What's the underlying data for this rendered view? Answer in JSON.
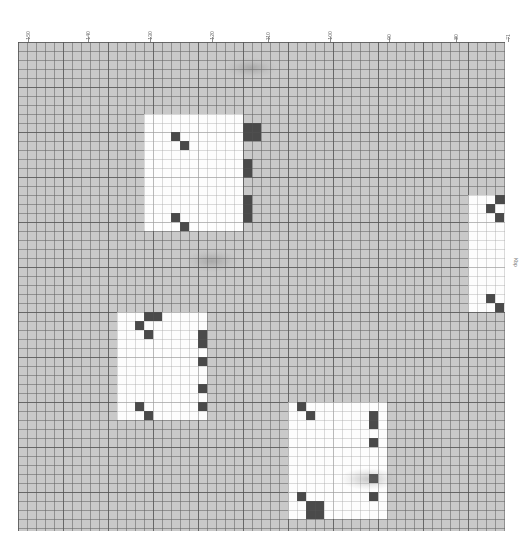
{
  "chart_data": {
    "type": "heatmap",
    "title": "",
    "xlabel": "",
    "ylabel": "",
    "grid": true,
    "legend_position": "none",
    "axis": {
      "orientation": "top",
      "direction": "descending",
      "range": [
        150,
        71
      ],
      "tick_labels": [
        "150",
        "140",
        "130",
        "120",
        "110",
        "100",
        "90",
        "80",
        "71"
      ],
      "tick_positions_px": [
        28,
        88,
        150,
        212,
        268,
        330,
        389,
        456,
        508
      ]
    },
    "right_edge_label": "Kbp",
    "cell_size_px": 9,
    "major_every_cells": 5,
    "colors": {
      "background": "#ffffff",
      "grid_fill": "#c9c9c9",
      "grid_line": "#5f5f5f",
      "block_light": "#fdfdfd",
      "block_dark": "#4a4a4a",
      "tick_text": "#6d6d6d"
    },
    "blocks": [
      {
        "id": "block-1",
        "x_px": 126,
        "y_px": 72,
        "w_px": 99,
        "h_px": 117,
        "notch": {
          "x_px": 126,
          "y_px": 72,
          "w_px": 18,
          "h_px": 27
        },
        "dark_cells": [
          {
            "x_px": 225,
            "y_px": 81,
            "w_px": 18,
            "h_px": 18
          },
          {
            "x_px": 153,
            "y_px": 90,
            "w_px": 9,
            "h_px": 9
          },
          {
            "x_px": 162,
            "y_px": 99,
            "w_px": 9,
            "h_px": 9
          },
          {
            "x_px": 225,
            "y_px": 117,
            "w_px": 9,
            "h_px": 18
          },
          {
            "x_px": 225,
            "y_px": 153,
            "w_px": 9,
            "h_px": 18
          },
          {
            "x_px": 225,
            "y_px": 171,
            "w_px": 9,
            "h_px": 9
          },
          {
            "x_px": 153,
            "y_px": 171,
            "w_px": 9,
            "h_px": 9
          },
          {
            "x_px": 162,
            "y_px": 180,
            "w_px": 9,
            "h_px": 9
          }
        ]
      },
      {
        "id": "block-2",
        "x_px": 450,
        "y_px": 153,
        "w_px": 55,
        "h_px": 117,
        "notch": {
          "x_px": 450,
          "y_px": 153,
          "w_px": 9,
          "h_px": 18
        },
        "dark_cells": [
          {
            "x_px": 477,
            "y_px": 153,
            "w_px": 18,
            "h_px": 9
          },
          {
            "x_px": 468,
            "y_px": 162,
            "w_px": 9,
            "h_px": 9
          },
          {
            "x_px": 477,
            "y_px": 171,
            "w_px": 9,
            "h_px": 9
          },
          {
            "x_px": 468,
            "y_px": 252,
            "w_px": 9,
            "h_px": 9
          },
          {
            "x_px": 477,
            "y_px": 261,
            "w_px": 9,
            "h_px": 9
          }
        ]
      },
      {
        "id": "block-3",
        "x_px": 99,
        "y_px": 270,
        "w_px": 90,
        "h_px": 108,
        "notch": {
          "x_px": 99,
          "y_px": 270,
          "w_px": 9,
          "h_px": 18
        },
        "dark_cells": [
          {
            "x_px": 126,
            "y_px": 270,
            "w_px": 18,
            "h_px": 9
          },
          {
            "x_px": 117,
            "y_px": 279,
            "w_px": 9,
            "h_px": 9
          },
          {
            "x_px": 126,
            "y_px": 288,
            "w_px": 9,
            "h_px": 9
          },
          {
            "x_px": 180,
            "y_px": 288,
            "w_px": 9,
            "h_px": 18
          },
          {
            "x_px": 180,
            "y_px": 315,
            "w_px": 9,
            "h_px": 9
          },
          {
            "x_px": 180,
            "y_px": 342,
            "w_px": 9,
            "h_px": 9
          },
          {
            "x_px": 180,
            "y_px": 360,
            "w_px": 9,
            "h_px": 9
          },
          {
            "x_px": 117,
            "y_px": 360,
            "w_px": 9,
            "h_px": 9
          },
          {
            "x_px": 126,
            "y_px": 369,
            "w_px": 9,
            "h_px": 9
          }
        ]
      },
      {
        "id": "block-4",
        "x_px": 270,
        "y_px": 360,
        "w_px": 99,
        "h_px": 117,
        "notch": {
          "x_px": 270,
          "y_px": 360,
          "w_px": 9,
          "h_px": 9
        },
        "dark_cells": [
          {
            "x_px": 279,
            "y_px": 360,
            "w_px": 9,
            "h_px": 9
          },
          {
            "x_px": 288,
            "y_px": 369,
            "w_px": 9,
            "h_px": 9
          },
          {
            "x_px": 351,
            "y_px": 369,
            "w_px": 9,
            "h_px": 18
          },
          {
            "x_px": 351,
            "y_px": 396,
            "w_px": 9,
            "h_px": 9
          },
          {
            "x_px": 351,
            "y_px": 432,
            "w_px": 9,
            "h_px": 9
          },
          {
            "x_px": 351,
            "y_px": 450,
            "w_px": 9,
            "h_px": 9
          },
          {
            "x_px": 279,
            "y_px": 450,
            "w_px": 9,
            "h_px": 9
          },
          {
            "x_px": 288,
            "y_px": 459,
            "w_px": 18,
            "h_px": 18
          }
        ]
      }
    ],
    "watermarks": [
      {
        "id": "watermark-top",
        "x_px": 207,
        "y_px": 16,
        "w_px": 52,
        "h_px": 20
      },
      {
        "id": "watermark-middle",
        "x_px": 168,
        "y_px": 208,
        "w_px": 52,
        "h_px": 22
      },
      {
        "id": "watermark-bottom",
        "x_px": 322,
        "y_px": 426,
        "w_px": 58,
        "h_px": 22
      }
    ]
  }
}
